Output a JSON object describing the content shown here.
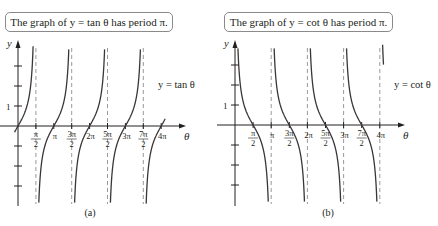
{
  "chart_data": [
    {
      "type": "line",
      "panel_label": "(a)",
      "title": "The graph of y = tan θ has period π.",
      "function": "tan",
      "curve_label": "y = tan θ",
      "xlabel": "θ",
      "ylabel": "y",
      "x_ticks": [
        "π/2",
        "π",
        "3π/2",
        "2π",
        "5π/2",
        "3π",
        "7π/2",
        "4π"
      ],
      "y_ticks": [
        3,
        2,
        1,
        -1,
        -2,
        -3
      ],
      "y_tick_labels": [
        "1"
      ],
      "asymptotes": [
        "π/2",
        "3π/2",
        "5π/2",
        "7π/2"
      ],
      "xlim": [
        -0.3,
        4.4
      ],
      "ylim": [
        -5,
        4.2
      ],
      "period": "π",
      "grid": false,
      "sample_points": [
        {
          "x": "0",
          "y": 0
        },
        {
          "x": "π/4",
          "y": 1
        },
        {
          "x": "π",
          "y": 0
        },
        {
          "x": "5π/4",
          "y": 1
        },
        {
          "x": "2π",
          "y": 0
        },
        {
          "x": "3π",
          "y": 0
        },
        {
          "x": "4π",
          "y": 0
        }
      ]
    },
    {
      "type": "line",
      "panel_label": "(b)",
      "title": "The graph of y = cot θ has period π.",
      "function": "cot",
      "curve_label": "y = cot θ",
      "xlabel": "θ",
      "ylabel": "y",
      "x_ticks": [
        "π/2",
        "π",
        "3π/2",
        "2π",
        "5π/2",
        "3π",
        "7π/2",
        "4π"
      ],
      "y_ticks": [
        3,
        2,
        1,
        -1,
        -2,
        -3
      ],
      "y_tick_labels": [
        "1"
      ],
      "asymptotes": [
        "0",
        "π",
        "2π",
        "3π",
        "4π"
      ],
      "xlim": [
        0,
        4.4
      ],
      "ylim": [
        -5,
        4.2
      ],
      "period": "π",
      "grid": false,
      "sample_points": [
        {
          "x": "π/4",
          "y": 1
        },
        {
          "x": "π/2",
          "y": 0
        },
        {
          "x": "3π/2",
          "y": 0
        },
        {
          "x": "5π/2",
          "y": 0
        },
        {
          "x": "7π/2",
          "y": 0
        }
      ]
    }
  ],
  "panels": {
    "a": {
      "title": "The graph of y = tan θ has period π.",
      "label": "(a)",
      "curve_label": "y = tan θ"
    },
    "b": {
      "title": "The graph of y = cot θ has period π.",
      "label": "(b)",
      "curve_label": "y = cot θ"
    }
  },
  "colors": {
    "curve": "#3a3536",
    "axis": "#231f20",
    "asymptote": "#7f7f7f",
    "box_border": "#8a8a8a"
  }
}
